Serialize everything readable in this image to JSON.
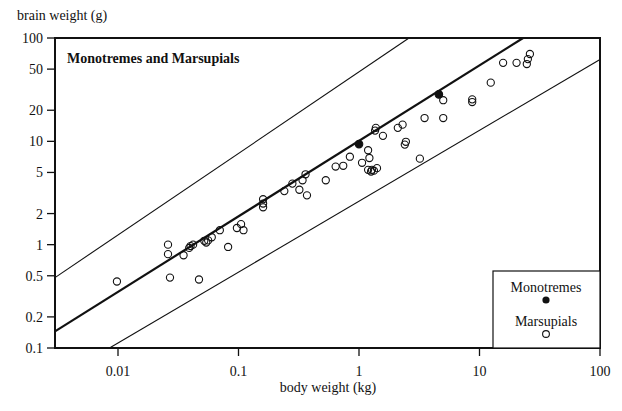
{
  "chart_data": {
    "type": "scatter",
    "title": "Monotremes and Marsupials",
    "xlabel": "body weight (kg)",
    "ylabel": "brain weight (g)",
    "xscale": "log",
    "yscale": "log",
    "xlim": [
      0.003,
      100
    ],
    "ylim": [
      0.1,
      100
    ],
    "xticks": [
      0.01,
      0.1,
      1,
      10,
      100
    ],
    "xtick_labels": [
      "0.01",
      "0.1",
      "1",
      "10",
      "100"
    ],
    "yticks": [
      0.1,
      0.2,
      0.5,
      1,
      2,
      5,
      10,
      20,
      50,
      100
    ],
    "ytick_labels": [
      "0.1",
      "0.2",
      "0.5",
      "1",
      "2",
      "5",
      "10",
      "20",
      "50",
      "100"
    ],
    "grid": false,
    "legend": {
      "position": "bottom-right",
      "entries": [
        {
          "label": "Monotremes",
          "marker": "filled-circle"
        },
        {
          "label": "Marsupials",
          "marker": "open-circle"
        }
      ]
    },
    "series": [
      {
        "name": "Monotremes",
        "marker": "filled-circle",
        "points": [
          [
            1.0,
            9.4
          ],
          [
            4.6,
            28.5
          ]
        ]
      },
      {
        "name": "Marsupials",
        "marker": "open-circle",
        "points": [
          [
            0.0098,
            0.44
          ],
          [
            0.026,
            1.0
          ],
          [
            0.026,
            0.81
          ],
          [
            0.027,
            0.48
          ],
          [
            0.035,
            0.79
          ],
          [
            0.039,
            0.93
          ],
          [
            0.04,
            0.97
          ],
          [
            0.042,
            1.0
          ],
          [
            0.047,
            0.46
          ],
          [
            0.052,
            1.09
          ],
          [
            0.054,
            1.05
          ],
          [
            0.056,
            1.1
          ],
          [
            0.06,
            1.18
          ],
          [
            0.07,
            1.38
          ],
          [
            0.082,
            0.95
          ],
          [
            0.097,
            1.45
          ],
          [
            0.105,
            1.58
          ],
          [
            0.11,
            1.38
          ],
          [
            0.16,
            2.3
          ],
          [
            0.16,
            2.5
          ],
          [
            0.16,
            2.75
          ],
          [
            0.24,
            3.3
          ],
          [
            0.28,
            3.9
          ],
          [
            0.32,
            3.4
          ],
          [
            0.34,
            4.2
          ],
          [
            0.36,
            4.8
          ],
          [
            0.37,
            3.0
          ],
          [
            0.53,
            4.2
          ],
          [
            0.64,
            5.7
          ],
          [
            0.74,
            5.8
          ],
          [
            0.84,
            7.1
          ],
          [
            1.06,
            6.2
          ],
          [
            1.19,
            8.2
          ],
          [
            1.22,
            6.9
          ],
          [
            1.19,
            5.3
          ],
          [
            1.26,
            5.1
          ],
          [
            1.28,
            5.3
          ],
          [
            1.33,
            5.2
          ],
          [
            1.41,
            5.5
          ],
          [
            1.36,
            12.7
          ],
          [
            1.38,
            13.5
          ],
          [
            1.58,
            11.3
          ],
          [
            2.1,
            13.5
          ],
          [
            2.3,
            14.5
          ],
          [
            2.4,
            9.3
          ],
          [
            2.45,
            9.9
          ],
          [
            3.2,
            6.8
          ],
          [
            3.5,
            16.8
          ],
          [
            5.0,
            25
          ],
          [
            5.0,
            16.8
          ],
          [
            8.7,
            25.5
          ],
          [
            8.7,
            24
          ],
          [
            12.4,
            37
          ],
          [
            15.7,
            57.5
          ],
          [
            20.3,
            57.5
          ],
          [
            24.7,
            56
          ],
          [
            25.2,
            62.5
          ],
          [
            26.2,
            70
          ]
        ]
      }
    ],
    "reference_lines": [
      {
        "name": "upper-bound-line",
        "style": "thin",
        "points": [
          [
            0.003,
            0.48
          ],
          [
            2.6,
            100
          ]
        ]
      },
      {
        "name": "regression-line",
        "style": "thick",
        "points": [
          [
            0.003,
            0.145
          ],
          [
            23,
            100
          ]
        ]
      },
      {
        "name": "lower-bound-line",
        "style": "thin",
        "points": [
          [
            0.0085,
            0.1
          ],
          [
            100,
            62
          ]
        ]
      }
    ]
  }
}
